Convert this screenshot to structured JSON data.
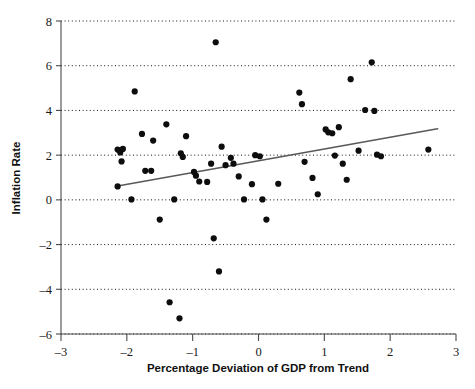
{
  "chart_data": {
    "type": "scatter",
    "title": "",
    "xlabel": "Percentage Deviation of GDP from Trend",
    "ylabel": "Inflation Rate",
    "xlim": [
      -3,
      3
    ],
    "ylim": [
      -6,
      8
    ],
    "xticks": [
      -3,
      -2,
      -1,
      0,
      1,
      2,
      3
    ],
    "yticks": [
      -6,
      -4,
      -2,
      0,
      2,
      4,
      6,
      8
    ],
    "xtick_labels": [
      "–3",
      "–2",
      "–1",
      "0",
      "1",
      "2",
      "3"
    ],
    "ytick_labels": [
      "–6",
      "–4",
      "–2",
      "0",
      "2",
      "4",
      "6",
      "8"
    ],
    "grid": "horizontal-dotted",
    "legend": "none",
    "marker_color": "#0d0d0d",
    "marker_size": 3.1,
    "trendline": {
      "type": "linear-fit",
      "color": "#595959",
      "x_start": -2.14,
      "y_start": 0.62,
      "x_end": 2.72,
      "y_end": 3.18
    },
    "points": [
      {
        "x": -2.14,
        "y": 2.25
      },
      {
        "x": -2.1,
        "y": 2.12
      },
      {
        "x": -2.06,
        "y": 2.28
      },
      {
        "x": -2.08,
        "y": 1.72
      },
      {
        "x": -2.14,
        "y": 0.6
      },
      {
        "x": -1.93,
        "y": 0.02
      },
      {
        "x": -1.88,
        "y": 4.85
      },
      {
        "x": -1.77,
        "y": 2.95
      },
      {
        "x": -1.72,
        "y": 1.3
      },
      {
        "x": -1.63,
        "y": 1.3
      },
      {
        "x": -1.6,
        "y": 2.65
      },
      {
        "x": -1.5,
        "y": -0.88
      },
      {
        "x": -1.4,
        "y": 3.38
      },
      {
        "x": -1.35,
        "y": -4.58
      },
      {
        "x": -1.28,
        "y": 0.02
      },
      {
        "x": -1.2,
        "y": -5.3
      },
      {
        "x": -1.18,
        "y": 2.08
      },
      {
        "x": -1.15,
        "y": 1.92
      },
      {
        "x": -1.1,
        "y": 2.85
      },
      {
        "x": -0.98,
        "y": 1.25
      },
      {
        "x": -0.95,
        "y": 1.08
      },
      {
        "x": -0.9,
        "y": 0.82
      },
      {
        "x": -0.78,
        "y": 0.8
      },
      {
        "x": -0.72,
        "y": 1.62
      },
      {
        "x": -0.68,
        "y": -1.72
      },
      {
        "x": -0.65,
        "y": 7.05
      },
      {
        "x": -0.6,
        "y": -3.2
      },
      {
        "x": -0.56,
        "y": 2.38
      },
      {
        "x": -0.5,
        "y": 1.55
      },
      {
        "x": -0.42,
        "y": 1.88
      },
      {
        "x": -0.38,
        "y": 1.62
      },
      {
        "x": -0.3,
        "y": 1.05
      },
      {
        "x": -0.22,
        "y": 0.02
      },
      {
        "x": -0.1,
        "y": 0.7
      },
      {
        "x": -0.05,
        "y": 2.0
      },
      {
        "x": 0.02,
        "y": 1.95
      },
      {
        "x": 0.06,
        "y": 0.02
      },
      {
        "x": 0.12,
        "y": -0.88
      },
      {
        "x": 0.3,
        "y": 0.72
      },
      {
        "x": 0.62,
        "y": 4.8
      },
      {
        "x": 0.66,
        "y": 4.28
      },
      {
        "x": 0.7,
        "y": 1.7
      },
      {
        "x": 0.82,
        "y": 0.98
      },
      {
        "x": 0.9,
        "y": 0.25
      },
      {
        "x": 1.02,
        "y": 3.15
      },
      {
        "x": 1.06,
        "y": 3.02
      },
      {
        "x": 1.12,
        "y": 2.98
      },
      {
        "x": 1.16,
        "y": 1.98
      },
      {
        "x": 1.22,
        "y": 3.25
      },
      {
        "x": 1.28,
        "y": 1.62
      },
      {
        "x": 1.34,
        "y": 0.9
      },
      {
        "x": 1.4,
        "y": 5.4
      },
      {
        "x": 1.52,
        "y": 2.2
      },
      {
        "x": 1.62,
        "y": 4.02
      },
      {
        "x": 1.72,
        "y": 6.15
      },
      {
        "x": 1.76,
        "y": 3.98
      },
      {
        "x": 1.8,
        "y": 2.02
      },
      {
        "x": 1.86,
        "y": 1.95
      },
      {
        "x": 2.58,
        "y": 2.25
      }
    ]
  }
}
